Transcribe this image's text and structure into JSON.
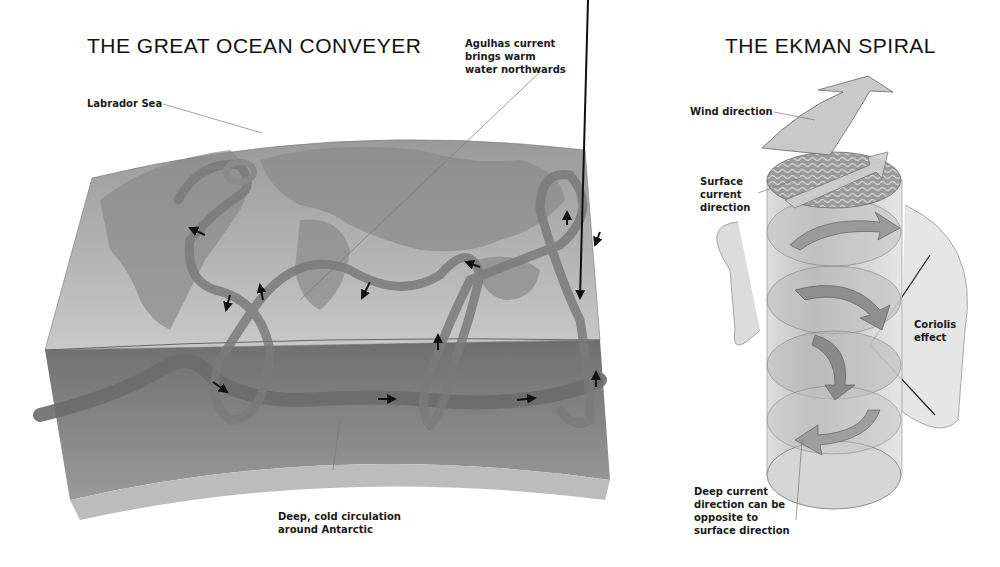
{
  "conveyer": {
    "title": "THE GREAT OCEAN CONVEYER",
    "labels": {
      "labrador": "Labrador Sea",
      "agulhas": "Agulhas current\nbrings warm\nwater northwards",
      "deep_cold": "Deep, cold circulation\naround Antarctic"
    }
  },
  "ekman": {
    "title": "THE EKMAN SPIRAL",
    "labels": {
      "wind": "Wind direction",
      "surface": "Surface\ncurrent\ndirection",
      "coriolis": "Coriolis\neffect",
      "deep": "Deep current\ndirection can be\nopposite to\nsurface direction"
    }
  },
  "colors": {
    "background": "#ffffff",
    "ocean_top": "#a8a8a8",
    "land": "#8c8c8c",
    "ribbon": "#6e6e6e",
    "deep_layer": "#7a7a7a",
    "cylinder": "#c8c8c8",
    "arrow_marker": "#111111"
  }
}
